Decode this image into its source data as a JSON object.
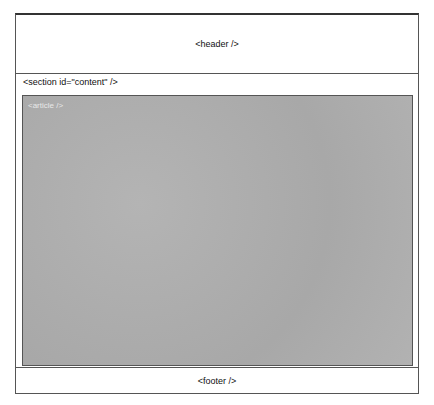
{
  "diagram": {
    "header": {
      "label": "<header />"
    },
    "section": {
      "label": "<section id=\"content\" />"
    },
    "article": {
      "label": "<article />"
    },
    "footer": {
      "label": "<footer />"
    }
  }
}
